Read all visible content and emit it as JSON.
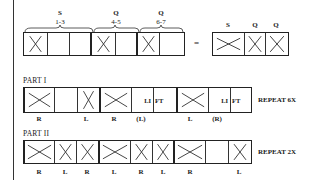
{
  "top": {
    "groups": [
      {
        "type": "S",
        "counts": "1-3"
      },
      {
        "type": "Q",
        "counts": "4-5"
      },
      {
        "type": "Q",
        "counts": "6-7"
      }
    ],
    "equals": "=",
    "summary_labels": [
      "S",
      "Q",
      "Q"
    ]
  },
  "part1": {
    "title": "PART I",
    "lift_text": [
      "LI",
      "FT"
    ],
    "lift_text2": [
      "LI",
      "FT"
    ],
    "foot_labels": [
      "R",
      "L",
      "R",
      "(L)",
      "L",
      "(R)"
    ],
    "repeat": "REPEAT 6X"
  },
  "part2": {
    "title": "PART II",
    "foot_labels": [
      "R",
      "L",
      "R",
      "L",
      "R",
      "L",
      "R",
      "L"
    ],
    "repeat": "REPEAT 2X"
  },
  "colors": {
    "ink": "#222222",
    "background": "#ffffff"
  }
}
